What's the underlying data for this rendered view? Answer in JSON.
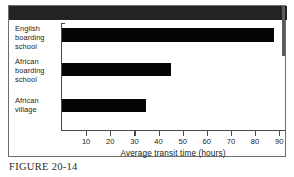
{
  "figure": {
    "caption": "FIGURE 20-14"
  },
  "chart_data": {
    "type": "bar",
    "orientation": "horizontal",
    "title": "",
    "subtitle": "",
    "categories": [
      "English boarding school",
      "African boarding school",
      "African village"
    ],
    "category_lines": [
      [
        "English",
        "boarding",
        "school"
      ],
      [
        "African",
        "boarding",
        "school"
      ],
      [
        "African",
        "village"
      ]
    ],
    "values": [
      88,
      45,
      35
    ],
    "series": [
      {
        "name": "Average transit time",
        "values": [
          88,
          45,
          35
        ]
      }
    ],
    "xlabel": "Average transit time (hours)",
    "ylabel": "",
    "xlim": [
      0,
      92
    ],
    "ylim": [
      0,
      3
    ],
    "xticks": [
      10,
      20,
      30,
      40,
      50,
      60,
      70,
      80,
      90
    ],
    "xtick_labels": [
      "10",
      "20",
      "30",
      "40",
      "50",
      "60",
      "70",
      "80",
      "90"
    ],
    "grid": false,
    "legend": false,
    "legend_position": "none",
    "bar_color": "#050505",
    "axis_color": "#4a4a4a",
    "background": "#ffffff"
  }
}
